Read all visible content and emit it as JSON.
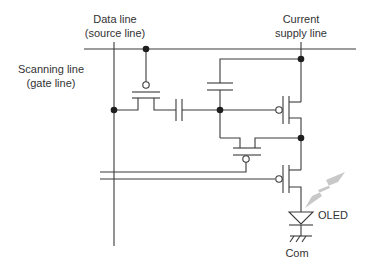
{
  "diagram": {
    "labels": {
      "data_line": "Data line",
      "data_line_sub": "(source line)",
      "supply_line": "Current",
      "supply_line_sub": "supply line",
      "scanning_line": "Scanning line",
      "scanning_line_sub": "(gate line)",
      "oled": "OLED",
      "com": "Com"
    },
    "components": [
      {
        "type": "p-channel-transistor",
        "role": "switching"
      },
      {
        "type": "capacitor",
        "role": "coupling"
      },
      {
        "type": "capacitor",
        "role": "storage"
      },
      {
        "type": "p-channel-transistor",
        "role": "driving"
      },
      {
        "type": "p-channel-transistor",
        "role": "threshold-compensation"
      },
      {
        "type": "p-channel-transistor",
        "role": "emission-control"
      },
      {
        "type": "oled-diode",
        "role": "light-emitter"
      },
      {
        "type": "ground",
        "role": "common"
      }
    ],
    "colors": {
      "wire": "#3a3a3a",
      "node": "#1e1e1e",
      "light": "#c8c8c8"
    }
  }
}
